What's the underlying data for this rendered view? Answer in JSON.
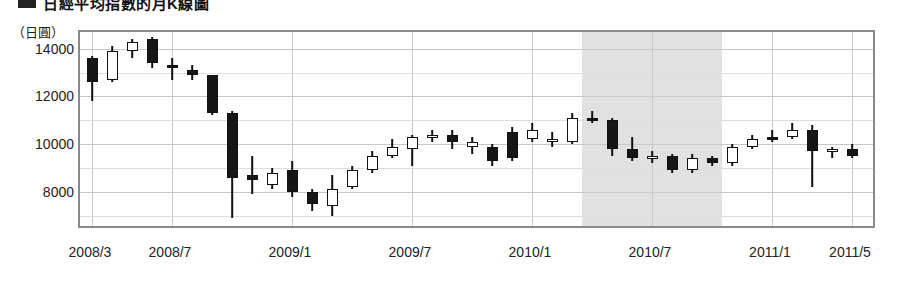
{
  "title": {
    "marker": "square-bullet",
    "text": "日經平均指數的月K線圖"
  },
  "axis": {
    "unit_label": "（日圓）",
    "y_ticks": [
      14000,
      12000,
      10000,
      8000
    ],
    "x_ticks": [
      "2008/3",
      "2008/7",
      "2009/1",
      "2009/7",
      "2010/1",
      "2010/7",
      "2011/1",
      "2011/5"
    ]
  },
  "colors": {
    "up_body": "#ffffff",
    "down_body": "#161616",
    "outline": "#111111",
    "frame": "#8a8a8a",
    "grid": "#c8c8c8",
    "band": "#dcdcdc"
  },
  "chart_data": {
    "type": "candlestick",
    "title": "日經平均指數的月K線圖",
    "xlabel": "",
    "ylabel": "（日圓）",
    "ylim": [
      6400,
      14700
    ],
    "grid": true,
    "legend": "none",
    "x_tick_labels": [
      "2008/3",
      "2008/7",
      "2009/1",
      "2009/7",
      "2010/1",
      "2010/7",
      "2011/1",
      "2011/5"
    ],
    "x_tick_months": [
      "2008/3",
      "2008/7",
      "2009/1",
      "2009/7",
      "2010/1",
      "2010/7",
      "2011/1",
      "2011/5"
    ],
    "y_tick_values": [
      14000,
      12000,
      10000,
      8000
    ],
    "shaded_region": {
      "from": "2010/4",
      "to": "2010/10",
      "color": "#dcdcdc",
      "label": ""
    },
    "candles": [
      {
        "month": "2008/3",
        "open": 13600,
        "high": 13700,
        "low": 11800,
        "close": 12600,
        "dir": "down"
      },
      {
        "month": "2008/4",
        "open": 12700,
        "high": 14100,
        "low": 12600,
        "close": 13900,
        "dir": "up"
      },
      {
        "month": "2008/5",
        "open": 13900,
        "high": 14400,
        "low": 13600,
        "close": 14300,
        "dir": "up"
      },
      {
        "month": "2008/6",
        "open": 14400,
        "high": 14500,
        "low": 13200,
        "close": 13400,
        "dir": "down"
      },
      {
        "month": "2008/7",
        "open": 13300,
        "high": 13600,
        "low": 12700,
        "close": 13200,
        "dir": "down"
      },
      {
        "month": "2008/8",
        "open": 13100,
        "high": 13300,
        "low": 12700,
        "close": 12900,
        "dir": "down"
      },
      {
        "month": "2008/9",
        "open": 12900,
        "high": 12900,
        "low": 11200,
        "close": 11300,
        "dir": "down"
      },
      {
        "month": "2008/10",
        "open": 11300,
        "high": 11400,
        "low": 6900,
        "close": 8600,
        "dir": "down"
      },
      {
        "month": "2008/11",
        "open": 8700,
        "high": 9500,
        "low": 7900,
        "close": 8500,
        "dir": "down"
      },
      {
        "month": "2008/12",
        "open": 8300,
        "high": 9000,
        "low": 8100,
        "close": 8800,
        "dir": "up"
      },
      {
        "month": "2009/1",
        "open": 8900,
        "high": 9300,
        "low": 7800,
        "close": 8000,
        "dir": "down"
      },
      {
        "month": "2009/2",
        "open": 8000,
        "high": 8100,
        "low": 7200,
        "close": 7500,
        "dir": "down"
      },
      {
        "month": "2009/3",
        "open": 7400,
        "high": 8700,
        "low": 7000,
        "close": 8100,
        "dir": "up"
      },
      {
        "month": "2009/4",
        "open": 8200,
        "high": 9100,
        "low": 8100,
        "close": 8900,
        "dir": "up"
      },
      {
        "month": "2009/5",
        "open": 8900,
        "high": 9700,
        "low": 8800,
        "close": 9500,
        "dir": "up"
      },
      {
        "month": "2009/6",
        "open": 9500,
        "high": 10200,
        "low": 9400,
        "close": 9900,
        "dir": "up"
      },
      {
        "month": "2009/7",
        "open": 9800,
        "high": 10400,
        "low": 9100,
        "close": 10300,
        "dir": "up"
      },
      {
        "month": "2009/8",
        "open": 10300,
        "high": 10600,
        "low": 10100,
        "close": 10400,
        "dir": "up"
      },
      {
        "month": "2009/9",
        "open": 10400,
        "high": 10600,
        "low": 9800,
        "close": 10100,
        "dir": "down"
      },
      {
        "month": "2009/10",
        "open": 10100,
        "high": 10300,
        "low": 9600,
        "close": 9900,
        "dir": "up"
      },
      {
        "month": "2009/11",
        "open": 9900,
        "high": 10000,
        "low": 9100,
        "close": 9300,
        "dir": "down"
      },
      {
        "month": "2009/12",
        "open": 9400,
        "high": 10700,
        "low": 9300,
        "close": 10500,
        "dir": "down"
      },
      {
        "month": "2010/1",
        "open": 10600,
        "high": 10900,
        "low": 10100,
        "close": 10200,
        "dir": "up"
      },
      {
        "month": "2010/2",
        "open": 10200,
        "high": 10500,
        "low": 9900,
        "close": 10100,
        "dir": "up"
      },
      {
        "month": "2010/3",
        "open": 10100,
        "high": 11300,
        "low": 10000,
        "close": 11100,
        "dir": "up"
      },
      {
        "month": "2010/4",
        "open": 11100,
        "high": 11400,
        "low": 10900,
        "close": 11000,
        "dir": "down"
      },
      {
        "month": "2010/5",
        "open": 11000,
        "high": 11100,
        "low": 9500,
        "close": 9800,
        "dir": "down"
      },
      {
        "month": "2010/6",
        "open": 9800,
        "high": 10300,
        "low": 9300,
        "close": 9400,
        "dir": "down"
      },
      {
        "month": "2010/7",
        "open": 9400,
        "high": 9700,
        "low": 9200,
        "close": 9500,
        "dir": "up"
      },
      {
        "month": "2010/8",
        "open": 9500,
        "high": 9600,
        "low": 8800,
        "close": 8900,
        "dir": "down"
      },
      {
        "month": "2010/9",
        "open": 8900,
        "high": 9600,
        "low": 8800,
        "close": 9400,
        "dir": "up"
      },
      {
        "month": "2010/10",
        "open": 9400,
        "high": 9500,
        "low": 9100,
        "close": 9200,
        "dir": "down"
      },
      {
        "month": "2010/11",
        "open": 9200,
        "high": 10000,
        "low": 9100,
        "close": 9900,
        "dir": "up"
      },
      {
        "month": "2010/12",
        "open": 9900,
        "high": 10400,
        "low": 9800,
        "close": 10200,
        "dir": "up"
      },
      {
        "month": "2011/1",
        "open": 10200,
        "high": 10600,
        "low": 10100,
        "close": 10300,
        "dir": "down"
      },
      {
        "month": "2011/2",
        "open": 10300,
        "high": 10900,
        "low": 10200,
        "close": 10600,
        "dir": "up"
      },
      {
        "month": "2011/3",
        "open": 10600,
        "high": 10800,
        "low": 8200,
        "close": 9700,
        "dir": "down"
      },
      {
        "month": "2011/4",
        "open": 9700,
        "high": 9900,
        "low": 9400,
        "close": 9800,
        "dir": "up"
      },
      {
        "month": "2011/5",
        "open": 9800,
        "high": 10000,
        "low": 9400,
        "close": 9500,
        "dir": "down"
      }
    ]
  }
}
